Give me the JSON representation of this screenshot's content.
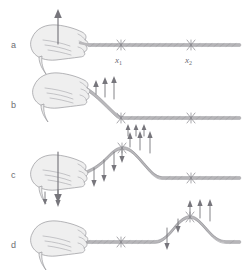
{
  "figure": {
    "background_color": "#ffffff",
    "ink_color": "#77767c",
    "rope_color": "#b9b8bb",
    "hand_color": "#efefef",
    "width": 243,
    "height": 279
  },
  "panels": [
    {
      "label": "a",
      "label_x": 14,
      "label_y": 45,
      "caption": "hand at rest holding the end of the rope, about to move upward",
      "baseline_y": 45
    },
    {
      "label": "b",
      "label_x": 14,
      "label_y": 105,
      "caption": "hand moves upward, rope near the hand starts to rise",
      "baseline_y": 118
    },
    {
      "label": "c",
      "label_x": 14,
      "label_y": 175,
      "caption": "hand moves back down, a pulse crest has formed and travels right",
      "baseline_y": 178
    },
    {
      "label": "d",
      "label_x": 14,
      "label_y": 248,
      "caption": "hand back at rest, the pulse has travelled further right past x1 toward x2",
      "baseline_y": 243
    }
  ],
  "markers": [
    {
      "name": "x1",
      "text": "x",
      "subscript": "1",
      "x": 121,
      "label_y": 60
    },
    {
      "name": "x2",
      "text": "x",
      "subscript": "2",
      "x": 191,
      "label_y": 60
    }
  ],
  "arrows": {
    "panel_a": [
      {
        "name": "hand-up-arrow",
        "direction": "up",
        "x": 58,
        "tail_y": 42,
        "head_y": 12
      }
    ],
    "panel_b": [
      {
        "name": "rope-up-arrow-1",
        "direction": "up",
        "x": 96,
        "tail_y": 94,
        "head_y": 82
      },
      {
        "name": "rope-up-arrow-2",
        "direction": "up",
        "x": 105,
        "tail_y": 96,
        "head_y": 78
      },
      {
        "name": "rope-up-arrow-3",
        "direction": "up",
        "x": 114,
        "tail_y": 97,
        "head_y": 76
      },
      {
        "name": "below-rope-arrow-1",
        "direction": "up",
        "x": 128,
        "tail_y": 135,
        "head_y": 126
      },
      {
        "name": "below-rope-arrow-2",
        "direction": "up",
        "x": 136,
        "tail_y": 135,
        "head_y": 126
      },
      {
        "name": "below-rope-arrow-3",
        "direction": "up",
        "x": 144,
        "tail_y": 135,
        "head_y": 126
      }
    ],
    "panel_c": [
      {
        "name": "hand-down-arrow",
        "direction": "down",
        "x": 58,
        "tail_y": 152,
        "head_y": 200
      },
      {
        "name": "left-flank-down-arrow-1",
        "direction": "down",
        "x": 94,
        "tail_y": 168,
        "head_y": 186
      },
      {
        "name": "left-flank-down-arrow-2",
        "direction": "down",
        "x": 104,
        "tail_y": 160,
        "head_y": 182
      },
      {
        "name": "left-flank-down-arrow-3",
        "direction": "down",
        "x": 114,
        "tail_y": 152,
        "head_y": 172
      },
      {
        "name": "crest-down-arrow",
        "direction": "down",
        "x": 122,
        "tail_y": 148,
        "head_y": 162
      },
      {
        "name": "crest-up-arrow-1",
        "direction": "up",
        "x": 130,
        "tail_y": 146,
        "head_y": 132
      },
      {
        "name": "crest-up-arrow-2",
        "direction": "up",
        "x": 140,
        "tail_y": 148,
        "head_y": 131
      },
      {
        "name": "crest-up-arrow-3",
        "direction": "up",
        "x": 150,
        "tail_y": 150,
        "head_y": 131
      }
    ],
    "panel_d": [
      {
        "name": "hand-region-down-arrow-1",
        "direction": "down",
        "x": 45,
        "tail_y": 190,
        "head_y": 205
      },
      {
        "name": "hand-region-down-arrow-2",
        "direction": "down",
        "x": 58,
        "tail_y": 188,
        "head_y": 207
      },
      {
        "name": "left-flank-down-arrow",
        "direction": "down",
        "x": 167,
        "tail_y": 228,
        "head_y": 248
      },
      {
        "name": "crest-down-arrow",
        "direction": "down",
        "x": 178,
        "tail_y": 218,
        "head_y": 232
      },
      {
        "name": "crest-up-arrow-1",
        "direction": "up",
        "x": 190,
        "tail_y": 214,
        "head_y": 200
      },
      {
        "name": "crest-up-arrow-2",
        "direction": "up",
        "x": 200,
        "tail_y": 216,
        "head_y": 199
      },
      {
        "name": "crest-up-arrow-3",
        "direction": "up",
        "x": 210,
        "tail_y": 218,
        "head_y": 199
      }
    ]
  }
}
